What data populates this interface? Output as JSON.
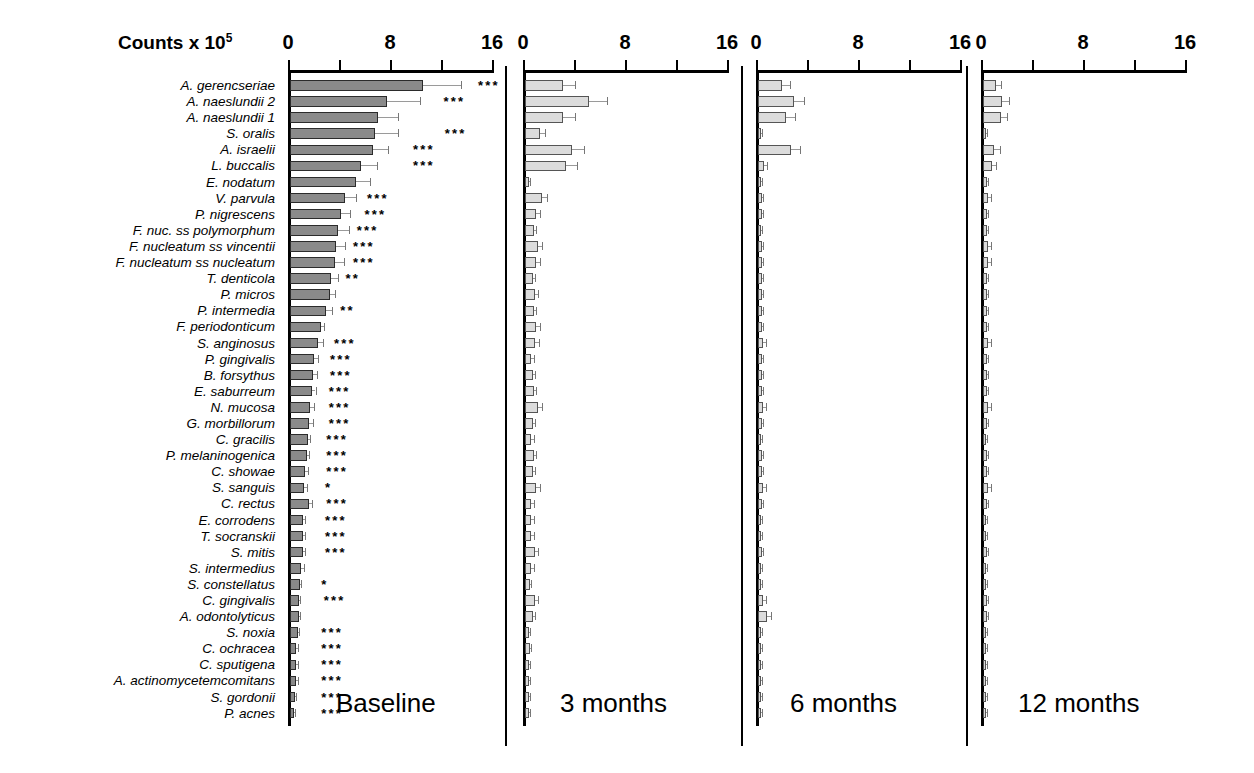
{
  "axis": {
    "title_text": "Counts x 10",
    "title_exponent": "5",
    "ticks": [
      "0",
      "8",
      "16"
    ],
    "tick_values": [
      0,
      8,
      16
    ],
    "xlim": [
      0,
      16
    ]
  },
  "panels": [
    {
      "name": "Baseline",
      "label": "Baseline"
    },
    {
      "name": "3 months",
      "label": "3 months"
    },
    {
      "name": "6 months",
      "label": "6 months"
    },
    {
      "name": "12 months",
      "label": "12 months"
    }
  ],
  "chart_data": {
    "type": "bar",
    "orientation": "horizontal",
    "xlabel": "Counts x 10^5",
    "ylabel": "",
    "xlim": [
      0,
      16
    ],
    "xticks": [
      0,
      8,
      16
    ],
    "grid": false,
    "legend": null,
    "panels": [
      "Baseline",
      "3 months",
      "6 months",
      "12 months"
    ],
    "categories": [
      "A. gerencseriae",
      "A. naeslundii 2",
      "A. naeslundii 1",
      "S. oralis",
      "A. israelii",
      "L. buccalis",
      "E. nodatum",
      "V. parvula",
      "P. nigrescens",
      "F. nuc. ss polymorphum",
      "F. nucleatum ss vincentii",
      "F. nucleatum ss nucleatum",
      "T. denticola",
      "P. micros",
      "P. intermedia",
      "F. periodonticum",
      "S. anginosus",
      "P. gingivalis",
      "B. forsythus",
      "E. saburreum",
      "N. mucosa",
      "G. morbillorum",
      "C. gracilis",
      "P. melaninogenica",
      "C. showae",
      "S. sanguis",
      "C. rectus",
      "E. corrodens",
      "T. socranskii",
      "S. mitis",
      "S. intermedius",
      "S. constellatus",
      "C. gingivalis",
      "A. odontolyticus",
      "S. noxia",
      "C. ochracea",
      "C. sputigena",
      "A. actinomycetemcomitans",
      "S. gordonii",
      "P. acnes"
    ],
    "series": [
      {
        "name": "Baseline",
        "values": [
          10.4,
          7.6,
          6.9,
          6.7,
          6.5,
          5.6,
          5.2,
          4.3,
          4.0,
          3.8,
          3.6,
          3.5,
          3.2,
          3.1,
          2.8,
          2.4,
          2.2,
          1.9,
          1.8,
          1.7,
          1.6,
          1.5,
          1.4,
          1.3,
          1.2,
          1.1,
          1.5,
          1.0,
          1.0,
          1.0,
          0.9,
          0.8,
          0.7,
          0.7,
          0.6,
          0.5,
          0.5,
          0.5,
          0.4,
          0.3
        ],
        "errors": [
          3.0,
          2.6,
          1.6,
          1.8,
          1.2,
          1.2,
          1.1,
          0.9,
          0.7,
          0.8,
          0.7,
          0.7,
          0.6,
          0.4,
          0.5,
          0.3,
          0.4,
          0.3,
          0.3,
          0.3,
          0.3,
          0.3,
          0.2,
          0.2,
          0.2,
          0.2,
          0.2,
          0.2,
          0.2,
          0.2,
          0.2,
          0.1,
          0.1,
          0.1,
          0.1,
          0.1,
          0.1,
          0.1,
          0.1,
          0.1
        ]
      },
      {
        "name": "3 months",
        "values": [
          3.0,
          5.0,
          3.0,
          1.2,
          3.7,
          3.2,
          0.3,
          1.3,
          0.9,
          0.7,
          1.0,
          0.9,
          0.6,
          0.8,
          0.7,
          0.9,
          0.8,
          0.5,
          0.6,
          0.7,
          1.0,
          0.6,
          0.5,
          0.7,
          0.6,
          0.9,
          0.5,
          0.5,
          0.5,
          0.8,
          0.5,
          0.4,
          0.8,
          0.6,
          0.3,
          0.4,
          0.3,
          0.3,
          0.3,
          0.3
        ],
        "errors": [
          0.9,
          1.4,
          0.9,
          0.4,
          0.9,
          0.9,
          0.1,
          0.4,
          0.3,
          0.2,
          0.3,
          0.3,
          0.2,
          0.2,
          0.2,
          0.3,
          0.3,
          0.2,
          0.2,
          0.2,
          0.3,
          0.2,
          0.2,
          0.2,
          0.2,
          0.3,
          0.2,
          0.2,
          0.2,
          0.2,
          0.2,
          0.1,
          0.2,
          0.2,
          0.1,
          0.1,
          0.1,
          0.1,
          0.1,
          0.1
        ]
      },
      {
        "name": "6 months",
        "values": [
          1.9,
          2.8,
          2.2,
          0.2,
          2.6,
          0.5,
          0.2,
          0.3,
          0.3,
          0.2,
          0.3,
          0.3,
          0.3,
          0.3,
          0.3,
          0.3,
          0.4,
          0.3,
          0.3,
          0.3,
          0.4,
          0.3,
          0.2,
          0.3,
          0.3,
          0.4,
          0.3,
          0.2,
          0.2,
          0.3,
          0.2,
          0.2,
          0.4,
          0.7,
          0.2,
          0.2,
          0.2,
          0.2,
          0.2,
          0.2
        ],
        "errors": [
          0.6,
          0.8,
          0.7,
          0.1,
          0.7,
          0.2,
          0.1,
          0.1,
          0.1,
          0.1,
          0.1,
          0.1,
          0.1,
          0.1,
          0.1,
          0.1,
          0.2,
          0.1,
          0.1,
          0.1,
          0.2,
          0.1,
          0.1,
          0.1,
          0.1,
          0.2,
          0.1,
          0.1,
          0.1,
          0.1,
          0.1,
          0.1,
          0.2,
          0.3,
          0.1,
          0.1,
          0.1,
          0.1,
          0.1,
          0.1
        ]
      },
      {
        "name": "12 months",
        "values": [
          1.0,
          1.5,
          1.4,
          0.2,
          0.9,
          0.7,
          0.3,
          0.4,
          0.3,
          0.3,
          0.4,
          0.4,
          0.3,
          0.3,
          0.3,
          0.3,
          0.4,
          0.3,
          0.3,
          0.3,
          0.4,
          0.3,
          0.2,
          0.3,
          0.3,
          0.4,
          0.3,
          0.2,
          0.2,
          0.3,
          0.2,
          0.2,
          0.3,
          0.3,
          0.2,
          0.2,
          0.2,
          0.2,
          0.2,
          0.2
        ],
        "errors": [
          0.4,
          0.5,
          0.5,
          0.1,
          0.4,
          0.3,
          0.1,
          0.2,
          0.1,
          0.1,
          0.2,
          0.2,
          0.1,
          0.1,
          0.1,
          0.1,
          0.2,
          0.1,
          0.1,
          0.1,
          0.2,
          0.1,
          0.1,
          0.1,
          0.1,
          0.2,
          0.1,
          0.1,
          0.1,
          0.1,
          0.1,
          0.1,
          0.1,
          0.1,
          0.1,
          0.1,
          0.1,
          0.1,
          0.1,
          0.1
        ]
      }
    ],
    "significance": [
      "***",
      "***",
      "",
      "***",
      "***",
      "***",
      "",
      "***",
      "***",
      "***",
      "***",
      "***",
      "**",
      "",
      "**",
      "",
      "***",
      "***",
      "***",
      "***",
      "***",
      "***",
      "***",
      "***",
      "***",
      "*",
      "***",
      "***",
      "***",
      "***",
      "",
      "*",
      "***",
      "",
      "***",
      "***",
      "***",
      "***",
      "***",
      "***"
    ],
    "significance_x": [
      14.9,
      12.2,
      0,
      12.3,
      9.8,
      9.8,
      0,
      6.2,
      6.0,
      5.4,
      5.1,
      5.1,
      4.5,
      0,
      4.1,
      0,
      3.6,
      3.3,
      3.3,
      3.2,
      3.2,
      3.2,
      3.0,
      3.0,
      3.0,
      2.9,
      3.0,
      2.9,
      2.9,
      2.9,
      0,
      2.6,
      2.8,
      0,
      2.6,
      2.6,
      2.6,
      2.6,
      2.6,
      2.6
    ]
  }
}
